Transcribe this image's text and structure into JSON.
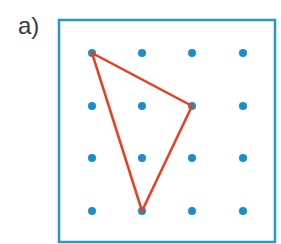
{
  "label": "a)",
  "colors": {
    "frame": "#2a97c8",
    "dot": "#1a8ec8",
    "triangle": "#e8401c"
  },
  "frame": {
    "x": 59,
    "y": 20,
    "width": 216,
    "height": 222
  },
  "grid": {
    "columns": [
      92,
      142,
      192,
      243
    ],
    "rows": [
      53,
      106,
      158,
      211
    ],
    "dot_radius": 4
  },
  "triangle": {
    "vertices": [
      [
        92,
        53
      ],
      [
        192,
        106
      ],
      [
        142,
        211
      ]
    ]
  }
}
